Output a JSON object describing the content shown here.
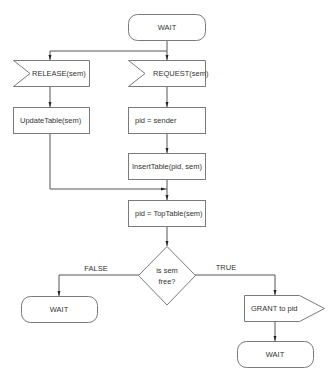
{
  "diagram": {
    "type": "flowchart",
    "nodes": {
      "start_wait": "WAIT",
      "release": "RELEASE(sem)",
      "request": "REQUEST(sem)",
      "update_table": "UpdateTable(sem)",
      "pid_sender": "pid = sender",
      "insert_table": "InsertTable(pid, sem)",
      "top_table": "pid = TopTable(sem)",
      "decision_line1": "is  sem",
      "decision_line2": "free?",
      "false_wait": "WAIT",
      "grant": "GRANT to pid",
      "end_wait": "WAIT"
    },
    "edge_labels": {
      "false": "FALSE",
      "true": "TRUE"
    }
  }
}
